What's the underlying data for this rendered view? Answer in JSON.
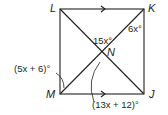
{
  "diagram": {
    "type": "square with diagonals",
    "points": {
      "L": "L",
      "K": "K",
      "M": "M",
      "J": "J",
      "N": "N"
    },
    "angles": {
      "angle_LNK": "15x°",
      "angle_NKL": "6x°",
      "angle_LMN": "(5x + 6)°",
      "angle_MNJ": "(13x + 12)°"
    },
    "parallel_marks": [
      "LK",
      "MJ"
    ]
  }
}
